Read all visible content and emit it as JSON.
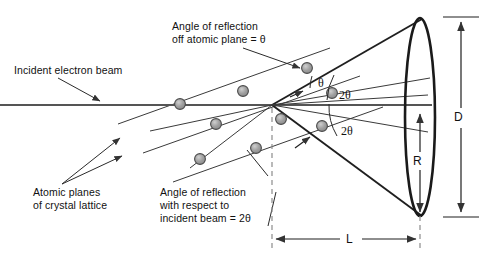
{
  "figure": {
    "kind": "electron-diffraction-geometry-diagram",
    "background": "#ffffff",
    "ink": "#333333",
    "atom_fill": "#9a9a9a",
    "atom_stroke": "#4a4a4a",
    "dash_color": "#8c8c8c"
  },
  "labels": {
    "incident_beam": "Incident electron beam",
    "angle_off_plane_line1": "Angle of reflection",
    "angle_off_plane_line2": "off atomic plane = θ",
    "atomic_planes_line1": "Atomic planes",
    "atomic_planes_line2": "of crystal lattice",
    "angle_wrt_beam_line1": "Angle of reflection",
    "angle_wrt_beam_line2": "with respect to",
    "angle_wrt_beam_line3": "incident beam = 2θ"
  },
  "angles": {
    "theta": "θ",
    "two_theta_upper": "2θ",
    "two_theta_lower": "2θ"
  },
  "dimensions": {
    "screen_diameter": "D",
    "ring_radius": "R",
    "camera_length": "L"
  }
}
